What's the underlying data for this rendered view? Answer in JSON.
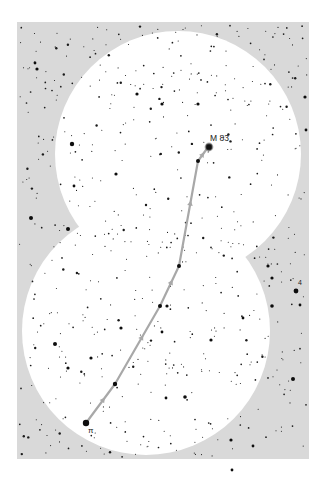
{
  "chart": {
    "panel": {
      "x": 17,
      "y": 22,
      "width": 292,
      "height": 437,
      "color": "#d9d9d9"
    },
    "fields_of_view": [
      {
        "name": "upper-field",
        "cx": 178,
        "cy": 154,
        "r": 123,
        "color": "#ffffff"
      },
      {
        "name": "lower-field",
        "cx": 146,
        "cy": 331,
        "r": 124,
        "color": "#ffffff"
      }
    ],
    "star_hop_path": {
      "color": "#a8a8a8",
      "points": [
        [
          86,
          423
        ],
        [
          115,
          384
        ],
        [
          160,
          306
        ],
        [
          179,
          266
        ],
        [
          198,
          161
        ],
        [
          206,
          150
        ]
      ]
    },
    "target": {
      "label": "M 83",
      "x": 209,
      "y": 147,
      "label_x": 210,
      "label_y": 141
    },
    "start_star": {
      "label": "π",
      "x": 86,
      "y": 423,
      "label_x": 88,
      "label_y": 433
    },
    "other_labels": [
      {
        "label": "4",
        "x": 298,
        "y": 285
      }
    ],
    "bright_stars": [
      [
        86,
        423,
        3.2
      ],
      [
        115,
        384,
        2.2
      ],
      [
        160,
        306,
        2.0
      ],
      [
        167,
        306,
        1.6
      ],
      [
        179,
        266,
        2.0
      ],
      [
        198,
        161,
        2.0
      ],
      [
        209,
        147,
        3.4
      ],
      [
        72,
        144,
        2.2
      ],
      [
        68,
        229,
        2.0
      ],
      [
        31,
        218,
        2.0
      ],
      [
        55,
        344,
        2.0
      ],
      [
        37,
        69,
        1.6
      ],
      [
        137,
        94,
        1.6
      ],
      [
        162,
        104,
        1.6
      ],
      [
        198,
        104,
        1.6
      ],
      [
        116,
        174,
        1.6
      ],
      [
        74,
        186,
        1.4
      ],
      [
        296,
        291,
        2.4
      ],
      [
        293,
        379,
        2.0
      ],
      [
        272,
        306,
        1.8
      ],
      [
        268,
        266,
        1.6
      ],
      [
        272,
        278,
        1.6
      ],
      [
        232,
        470,
        1.4
      ],
      [
        185,
        397,
        1.8
      ],
      [
        166,
        398,
        1.4
      ],
      [
        211,
        340,
        1.6
      ],
      [
        243,
        318,
        1.4
      ],
      [
        121,
        328,
        1.6
      ],
      [
        68,
        368,
        1.6
      ],
      [
        162,
        332,
        1.4
      ],
      [
        91,
        358,
        1.6
      ],
      [
        305,
        97,
        1.6
      ],
      [
        306,
        130,
        1.4
      ],
      [
        35,
        63,
        1.4
      ],
      [
        300,
        305,
        1.4
      ],
      [
        231,
        440,
        1.6
      ],
      [
        253,
        446,
        1.4
      ]
    ],
    "faint_star_count": 620,
    "faint_star_seed": 83
  }
}
